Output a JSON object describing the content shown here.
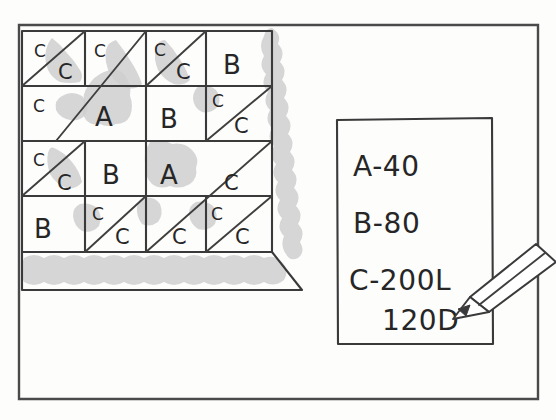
{
  "drawing": {
    "title": "hand-drawn floor plan tile layout sketch",
    "ink_color": "#3a3a3a",
    "shade_color": "#cfcfcf",
    "paper_color": "#fdfdfc"
  },
  "legend": {
    "name": "quantity-legend-box",
    "lines": [
      {
        "id": "legend-a",
        "text": "A-40"
      },
      {
        "id": "legend-b",
        "text": "B-80"
      },
      {
        "id": "legend-c",
        "text": "C-200L"
      },
      {
        "id": "legend-d",
        "text": "120D"
      }
    ]
  },
  "pencil": {
    "name": "pencil-pointer",
    "points_to": "120D"
  },
  "grid": {
    "name": "tile-grid",
    "rows": [
      {
        "row": 1,
        "cells": [
          {
            "id": "r1c1",
            "type": "split-diagonal",
            "upper_label": "C",
            "lower_label": "C",
            "shaded": "lower"
          },
          {
            "id": "r1c2",
            "type": "diagonal",
            "upper_label": "C",
            "lower_label": "",
            "shaded": "lower"
          },
          {
            "id": "r1c3",
            "type": "split-diagonal",
            "upper_label": "C",
            "lower_label": "C",
            "shaded": "lower"
          },
          {
            "id": "r1c4",
            "type": "plain",
            "upper_label": "B",
            "lower_label": "",
            "shaded": "none"
          }
        ]
      },
      {
        "row": 2,
        "cells": [
          {
            "id": "r2c1",
            "type": "diagonal",
            "upper_label": "C",
            "lower_label": "",
            "shaded": "none"
          },
          {
            "id": "r2c2",
            "type": "plain",
            "upper_label": "A",
            "lower_label": "",
            "shaded": "full"
          },
          {
            "id": "r2c3",
            "type": "plain",
            "upper_label": "B",
            "lower_label": "",
            "shaded": "none"
          },
          {
            "id": "r2c4",
            "type": "split-diagonal",
            "upper_label": "C",
            "lower_label": "C",
            "shaded": "upper"
          }
        ]
      },
      {
        "row": 3,
        "cells": [
          {
            "id": "r3c1",
            "type": "split-diagonal",
            "upper_label": "C",
            "lower_label": "C",
            "shaded": "lower"
          },
          {
            "id": "r3c2",
            "type": "plain",
            "upper_label": "B",
            "lower_label": "",
            "shaded": "none"
          },
          {
            "id": "r3c3",
            "type": "plain",
            "upper_label": "A",
            "lower_label": "",
            "shaded": "full"
          },
          {
            "id": "r3c4",
            "type": "diagonal",
            "upper_label": "",
            "lower_label": "C",
            "shaded": "none"
          }
        ]
      },
      {
        "row": 4,
        "cells": [
          {
            "id": "r4c1",
            "type": "plain",
            "upper_label": "B",
            "lower_label": "",
            "shaded": "none"
          },
          {
            "id": "r4c2",
            "type": "split-diagonal",
            "upper_label": "C",
            "lower_label": "C",
            "shaded": "upper"
          },
          {
            "id": "r4c3",
            "type": "diagonal",
            "upper_label": "",
            "lower_label": "C",
            "shaded": "none"
          },
          {
            "id": "r4c4",
            "type": "split-diagonal",
            "upper_label": "C",
            "lower_label": "C",
            "shaded": "upper"
          }
        ]
      }
    ]
  },
  "shading_bands": {
    "right_band": "vertical shaded strip along right edge of grid",
    "bottom_band": "horizontal shaded strip along bottom edge of grid"
  }
}
